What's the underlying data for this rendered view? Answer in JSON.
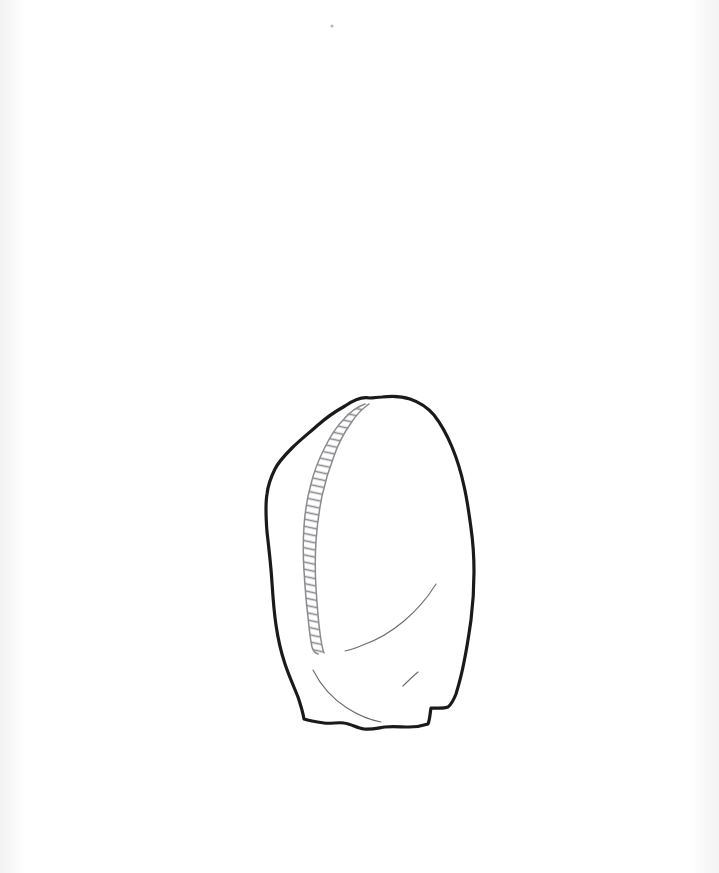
{
  "page": {
    "background_color": "#ffffff",
    "width": 719,
    "height": 873,
    "paper_edge_tint": "#f2f2f3",
    "caption": ""
  },
  "figure": {
    "kind": "archaeological-line-drawing",
    "view": "dorsal-face",
    "ink_color": "#1a1a1a",
    "interior_line_color": "#6b6b70",
    "hatch_line_color": "#8a8a8f",
    "outline_stroke_width": 3.2,
    "interior_stroke_width": 1.1,
    "bounding_box": {
      "x": 265,
      "y": 396,
      "width": 210,
      "height": 340
    },
    "elements": [
      {
        "name": "artifact-outline",
        "description": "Closed irregular outline of the stone tool: pointed apex at top, bulging right margin, flat irregular base"
      },
      {
        "name": "retouched-edge-hatching",
        "description": "Ladder-style hatched double line marking the retouched left dorsal ridge running from apex to lower left"
      },
      {
        "name": "flake-scar-upper",
        "description": "Faint concave arc in the mid-right area indicating an upper flake scar ridge"
      },
      {
        "name": "flake-scar-lower",
        "description": "Faint concave arc across the lower body indicating a lower flake scar ridge"
      },
      {
        "name": "tick-mark",
        "description": "Short oblique stroke near the lower right interior"
      }
    ]
  },
  "artwork_paths": {
    "outline": "M 370 398 C 361 396 352 401 345 406 C 336 411 327 417 318 425 C 309 433 300 440 292 448 C 285 455 279 461 275 469 C 271 477 268 485 267 494 C 265 506 266 519 267 532 C 269 549 271 566 272 583 C 273 598 274 612 276 625 C 278 639 281 652 285 664 C 289 676 294 687 298 697 C 301 706 303 713 304 719 C 310 721 317 722 324 723 C 331 724 338 722 344 723 C 351 724 357 728 364 729 C 371 730 378 728 385 727 C 393 726 401 727 409 727 C 416 727 422 726 428 724 C 430 719 430 713 431 708 C 437 708 443 709 448 707 C 452 704 454 699 456 694 C 459 684 462 673 464 662 C 467 648 469 634 471 620 C 473 604 474 588 474 572 C 474 557 473 542 471 528 C 469 513 467 499 464 486 C 461 472 457 459 452 447 C 447 435 441 424 434 415 C 427 407 419 402 410 399 C 401 396 391 396 382 397 C 378 397 374 398 370 398 Z",
    "hatch_rail_outer": "M 365 404 C 357 407 350 412 344 419 C 336 427 330 437 325 447 C 319 459 314 471 311 484 C 307 498 305 512 304 526 C 303 541 303 556 304 571 C 305 587 306 602 308 617 C 309 628 310 638 312 647 C 313 651 315 653 318 654",
    "hatch_rail_inner": "M 369 404 C 362 409 356 415 351 423 C 344 433 338 444 334 456 C 329 469 325 482 322 496 C 319 511 317 526 316 541 C 315 557 315 572 316 588 C 317 604 318 619 320 633 C 321 641 322 648 324 653",
    "flake_scar_upper": "M 436 584 C 428 597 417 610 404 621 C 391 632 377 640 363 645 C 356 648 350 650 345 651",
    "flake_scar_lower": "M 313 670 C 321 686 333 699 347 708 C 358 715 370 720 381 722",
    "tick_mark": "M 418 672 C 412 677 407 682 403 686"
  },
  "stray_marks": [
    {
      "name": "scan-speck",
      "x": 332,
      "y": 26,
      "radius": 1.6,
      "color": "#b9b9bd"
    }
  ]
}
